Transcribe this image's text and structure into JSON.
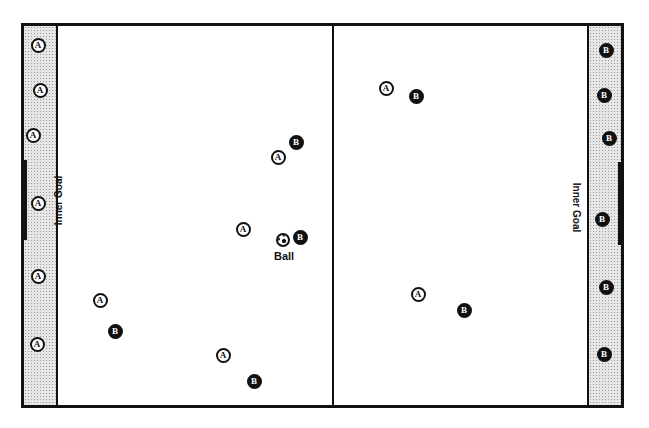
{
  "diagram": {
    "type": "playing-field",
    "colors": {
      "line": "#111111",
      "zone_fill": "#e6e6e6",
      "team_a_fill": "#ffffff",
      "team_b_fill": "#111111"
    },
    "labels": {
      "left_goal": "Inner Goal",
      "right_goal": "Inner Goal",
      "ball": "Ball"
    },
    "team_a_marker": "A",
    "team_b_marker": "B",
    "players": [
      {
        "team": "A",
        "label": "A",
        "x": 38,
        "y": 45,
        "zone": "left-end"
      },
      {
        "team": "A",
        "label": "A",
        "x": 40,
        "y": 90,
        "zone": "left-end"
      },
      {
        "team": "A",
        "label": "A",
        "x": 33,
        "y": 135,
        "zone": "left-end"
      },
      {
        "team": "A",
        "label": "A",
        "x": 38,
        "y": 203,
        "zone": "left-end"
      },
      {
        "team": "A",
        "label": "A",
        "x": 38,
        "y": 276,
        "zone": "left-end"
      },
      {
        "team": "A",
        "label": "A",
        "x": 37,
        "y": 344,
        "zone": "left-end"
      },
      {
        "team": "A",
        "label": "A",
        "x": 100,
        "y": 300,
        "zone": "field"
      },
      {
        "team": "B",
        "label": "B",
        "x": 115,
        "y": 331,
        "zone": "field"
      },
      {
        "team": "A",
        "label": "A",
        "x": 278,
        "y": 157,
        "zone": "field"
      },
      {
        "team": "B",
        "label": "B",
        "x": 296,
        "y": 142,
        "zone": "field"
      },
      {
        "team": "A",
        "label": "A",
        "x": 243,
        "y": 229,
        "zone": "field"
      },
      {
        "team": "B",
        "label": "B",
        "x": 300,
        "y": 237,
        "zone": "field"
      },
      {
        "team": "A",
        "label": "A",
        "x": 223,
        "y": 355,
        "zone": "field"
      },
      {
        "team": "B",
        "label": "B",
        "x": 254,
        "y": 381,
        "zone": "field"
      },
      {
        "team": "A",
        "label": "A",
        "x": 386,
        "y": 88,
        "zone": "field"
      },
      {
        "team": "B",
        "label": "B",
        "x": 416,
        "y": 96,
        "zone": "field"
      },
      {
        "team": "A",
        "label": "A",
        "x": 418,
        "y": 294,
        "zone": "field"
      },
      {
        "team": "B",
        "label": "B",
        "x": 464,
        "y": 310,
        "zone": "field"
      },
      {
        "team": "B",
        "label": "B",
        "x": 606,
        "y": 50,
        "zone": "right-end"
      },
      {
        "team": "B",
        "label": "B",
        "x": 604,
        "y": 95,
        "zone": "right-end"
      },
      {
        "team": "B",
        "label": "B",
        "x": 609,
        "y": 138,
        "zone": "right-end"
      },
      {
        "team": "B",
        "label": "B",
        "x": 602,
        "y": 219,
        "zone": "right-end"
      },
      {
        "team": "B",
        "label": "B",
        "x": 606,
        "y": 287,
        "zone": "right-end"
      },
      {
        "team": "B",
        "label": "B",
        "x": 604,
        "y": 354,
        "zone": "right-end"
      }
    ],
    "ball": {
      "x": 283,
      "y": 240
    }
  }
}
